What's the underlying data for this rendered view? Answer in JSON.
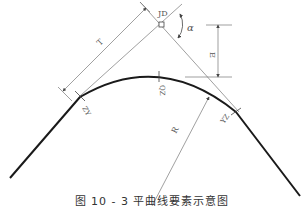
{
  "diagram": {
    "title": "平曲线要素示意图",
    "caption": "图 10 - 3   平曲线要素示意图",
    "labels": {
      "intersection_point": "JD",
      "deflection_angle": "α",
      "tangent_length": "T",
      "external_distance": "E",
      "radius": "R",
      "curve_start": "ZY",
      "curve_middle": "QZ",
      "curve_end": "YZ"
    },
    "colors": {
      "curve": "#1a1a1a",
      "construction": "#777777",
      "text": "#555555"
    }
  }
}
